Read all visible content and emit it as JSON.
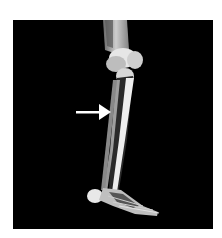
{
  "image": {
    "subject": "lower-leg-skeleton-3d-render",
    "background_color": "#000000",
    "frame_color": "#ffffff",
    "bone_color": "#e8e8e8",
    "annotation": {
      "type": "arrow",
      "direction": "right",
      "color": "#ffffff",
      "points_to": "tibia-shaft"
    }
  }
}
